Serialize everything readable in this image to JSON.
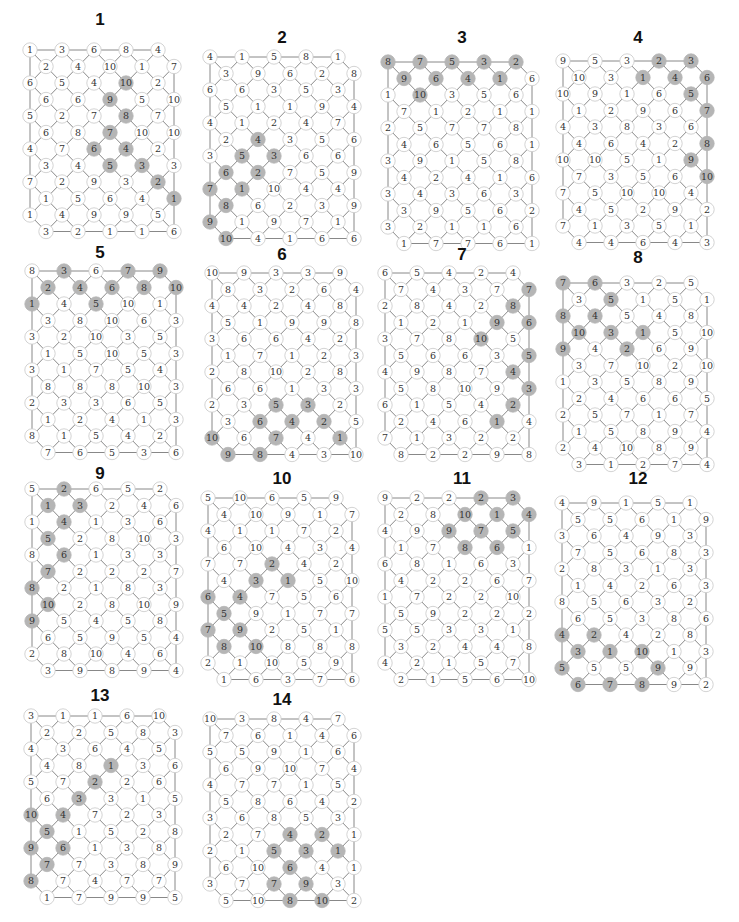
{
  "style": {
    "node_fill": "#ffffff",
    "node_stroke": "#c8c8c8",
    "shaded_fill": "#b5b5b5",
    "edge_color": "#6a6a6a",
    "text_color": "#333333"
  },
  "puzzles": [
    {
      "id": "1",
      "title": "1",
      "origin": [
        30,
        50
      ],
      "title_pos": [
        100,
        10
      ],
      "rows": [
        [
          "1",
          "3",
          "6",
          "8",
          "4"
        ],
        [
          "2",
          "4",
          "10",
          "1",
          "7"
        ],
        [
          "6",
          "5",
          "4",
          "10*",
          "2"
        ],
        [
          "6",
          "6",
          "9*",
          "5",
          "10"
        ],
        [
          "5",
          "2",
          "7",
          "8*",
          "7"
        ],
        [
          "6",
          "8",
          "7*",
          "10",
          "10"
        ],
        [
          "4",
          "7",
          "6*",
          "4*",
          "2"
        ],
        [
          "3",
          "4",
          "5*",
          "3*",
          "3"
        ],
        [
          "7",
          "2",
          "9",
          "3",
          "2*"
        ],
        [
          "1",
          "5",
          "6",
          "4",
          "1*"
        ],
        [
          "1",
          "4",
          "9",
          "9",
          "5"
        ],
        [
          "3",
          "2",
          "1",
          "1",
          "6"
        ]
      ]
    },
    {
      "id": "2",
      "title": "2",
      "origin": [
        210,
        57
      ],
      "title_pos": [
        282,
        28
      ],
      "rows": [
        [
          "4",
          "1",
          "5",
          "8",
          "1"
        ],
        [
          "3",
          "9",
          "6",
          "2",
          "8"
        ],
        [
          "6",
          "6",
          "3",
          "5",
          "3"
        ],
        [
          "5",
          "1",
          "1",
          "9",
          "4"
        ],
        [
          "4",
          "1",
          "2",
          "4",
          "7"
        ],
        [
          "2",
          "4*",
          "3",
          "5",
          "6"
        ],
        [
          "3",
          "5*",
          "3*",
          "6",
          "6"
        ],
        [
          "6*",
          "2*",
          "7",
          "5",
          "9"
        ],
        [
          "7*",
          "1*",
          "10",
          "4",
          "4"
        ],
        [
          "8*",
          "6",
          "2",
          "3",
          "9"
        ],
        [
          "9*",
          "1",
          "9",
          "7",
          "1"
        ],
        [
          "10*",
          "4",
          "1",
          "6",
          "6"
        ]
      ]
    },
    {
      "id": "3",
      "title": "3",
      "origin": [
        388,
        62
      ],
      "title_pos": [
        462,
        28
      ],
      "rows": [
        [
          "8*",
          "7*",
          "5*",
          "3*",
          "2*"
        ],
        [
          "9*",
          "6*",
          "4*",
          "1*",
          "6"
        ],
        [
          "1",
          "10*",
          "3",
          "5",
          "6"
        ],
        [
          "7",
          "1",
          "2",
          "1",
          "1"
        ],
        [
          "2",
          "5",
          "7",
          "7",
          "8"
        ],
        [
          "4",
          "6",
          "5",
          "6",
          "1"
        ],
        [
          "3",
          "9",
          "1",
          "5",
          "8"
        ],
        [
          "4",
          "2",
          "4",
          "1",
          "6"
        ],
        [
          "3",
          "4",
          "3",
          "6",
          "3"
        ],
        [
          "3",
          "9",
          "5",
          "6",
          "2"
        ],
        [
          "3",
          "2",
          "1",
          "1",
          "6"
        ],
        [
          "1",
          "7",
          "7",
          "6",
          "1"
        ]
      ]
    },
    {
      "id": "4",
      "title": "4",
      "origin": [
        563,
        61
      ],
      "title_pos": [
        638,
        28
      ],
      "rows": [
        [
          "9",
          "5",
          "3",
          "2*",
          "3*"
        ],
        [
          "10",
          "3",
          "1*",
          "4*",
          "6*"
        ],
        [
          "10",
          "9",
          "1",
          "6",
          "5*"
        ],
        [
          "1",
          "2",
          "9",
          "6",
          "7*"
        ],
        [
          "4",
          "3",
          "8",
          "3",
          "6"
        ],
        [
          "4",
          "6",
          "4",
          "2",
          "8*"
        ],
        [
          "10",
          "10",
          "5",
          "1",
          "9*"
        ],
        [
          "7",
          "3",
          "5",
          "6",
          "10*"
        ],
        [
          "7",
          "5",
          "10",
          "10",
          "4"
        ],
        [
          "4",
          "5",
          "2",
          "9",
          "2"
        ],
        [
          "7",
          "1",
          "3",
          "5",
          "1"
        ],
        [
          "4",
          "4",
          "6",
          "4",
          "3"
        ]
      ]
    },
    {
      "id": "5",
      "title": "5",
      "origin": [
        32,
        271
      ],
      "title_pos": [
        100,
        243
      ],
      "rows": [
        [
          "8",
          "3*",
          "6",
          "7*",
          "9*"
        ],
        [
          "2*",
          "4*",
          "6*",
          "8*",
          "10*"
        ],
        [
          "1*",
          "4",
          "5*",
          "10",
          "1"
        ],
        [
          "3",
          "8",
          "10",
          "6",
          "3"
        ],
        [
          "3",
          "2",
          "10",
          "3",
          "5"
        ],
        [
          "1",
          "5",
          "10",
          "5",
          "3"
        ],
        [
          "3",
          "1",
          "7",
          "5",
          "4"
        ],
        [
          "8",
          "8",
          "8",
          "10",
          "3"
        ],
        [
          "2",
          "3",
          "3",
          "6",
          "5"
        ],
        [
          "1",
          "2",
          "4",
          "1",
          "3"
        ],
        [
          "8",
          "1",
          "5",
          "4",
          "2"
        ],
        [
          "7",
          "6",
          "5",
          "3",
          "6"
        ]
      ]
    },
    {
      "id": "6",
      "title": "6",
      "origin": [
        212,
        273
      ],
      "title_pos": [
        282,
        245
      ],
      "rows": [
        [
          "10",
          "9",
          "3",
          "3",
          "9"
        ],
        [
          "8",
          "3",
          "2",
          "6",
          "4"
        ],
        [
          "4",
          "4",
          "2",
          "4",
          "8"
        ],
        [
          "5",
          "1",
          "9",
          "9",
          "8"
        ],
        [
          "3",
          "6",
          "6",
          "4",
          "2"
        ],
        [
          "1",
          "7",
          "1",
          "2",
          "3"
        ],
        [
          "2",
          "8",
          "10",
          "2",
          "8"
        ],
        [
          "6",
          "6",
          "1",
          "3",
          "3"
        ],
        [
          "2",
          "3",
          "5*",
          "3*",
          "2"
        ],
        [
          "3",
          "6*",
          "4*",
          "2*",
          "5"
        ],
        [
          "10*",
          "6",
          "7*",
          "4",
          "1*"
        ],
        [
          "9*",
          "8*",
          "4",
          "3",
          "10"
        ]
      ]
    },
    {
      "id": "7",
      "title": "7",
      "origin": [
        385,
        273
      ],
      "title_pos": [
        462,
        245
      ],
      "rows": [
        [
          "6",
          "5",
          "4",
          "2",
          "4"
        ],
        [
          "7",
          "4",
          "3",
          "7",
          "7*"
        ],
        [
          "2",
          "8",
          "4",
          "2",
          "8*"
        ],
        [
          "1",
          "2",
          "1",
          "9*",
          "6*"
        ],
        [
          "3",
          "7",
          "8",
          "10*",
          "5"
        ],
        [
          "5",
          "6",
          "6",
          "3",
          "5*"
        ],
        [
          "4",
          "9",
          "8",
          "7",
          "4*"
        ],
        [
          "5",
          "8",
          "10",
          "9",
          "3*"
        ],
        [
          "6",
          "1",
          "5",
          "4",
          "2*"
        ],
        [
          "2",
          "4",
          "6",
          "1*",
          "4"
        ],
        [
          "7",
          "1",
          "3",
          "2",
          "2"
        ],
        [
          "8",
          "2",
          "2",
          "9",
          "8"
        ]
      ]
    },
    {
      "id": "8",
      "title": "8",
      "origin": [
        563,
        283
      ],
      "title_pos": [
        638,
        248
      ],
      "rows": [
        [
          "7*",
          "6*",
          "3",
          "2",
          "5"
        ],
        [
          "3",
          "5*",
          "1",
          "5",
          "1"
        ],
        [
          "8*",
          "4*",
          "5",
          "4",
          "8"
        ],
        [
          "10*",
          "3*",
          "1*",
          "5",
          "10"
        ],
        [
          "9*",
          "4",
          "2*",
          "6",
          "9"
        ],
        [
          "3",
          "7",
          "10",
          "2",
          "10"
        ],
        [
          "1",
          "3",
          "5",
          "8",
          "9"
        ],
        [
          "2",
          "4",
          "6",
          "6",
          "5"
        ],
        [
          "2",
          "5",
          "7",
          "1",
          "7"
        ],
        [
          "1",
          "5",
          "8",
          "9",
          "4"
        ],
        [
          "2",
          "4",
          "10",
          "8",
          "9"
        ],
        [
          "3",
          "1",
          "2",
          "7",
          "4"
        ]
      ]
    },
    {
      "id": "9",
      "title": "9",
      "origin": [
        32,
        489
      ],
      "title_pos": [
        100,
        464
      ],
      "rows": [
        [
          "5",
          "2*",
          "6",
          "5",
          "2"
        ],
        [
          "1*",
          "3*",
          "2",
          "4",
          "6"
        ],
        [
          "1",
          "4*",
          "1",
          "3",
          "6"
        ],
        [
          "5*",
          "2",
          "8",
          "10",
          "3"
        ],
        [
          "8",
          "6*",
          "1",
          "3",
          "3"
        ],
        [
          "7*",
          "2",
          "2",
          "2",
          "7"
        ],
        [
          "8*",
          "2",
          "1",
          "8",
          "3"
        ],
        [
          "10*",
          "2",
          "8",
          "10",
          "9"
        ],
        [
          "9*",
          "5",
          "4",
          "5",
          "8"
        ],
        [
          "6",
          "5",
          "9",
          "5",
          "4"
        ],
        [
          "2",
          "8",
          "10",
          "4",
          "6"
        ],
        [
          "3",
          "9",
          "8",
          "9",
          "4"
        ]
      ]
    },
    {
      "id": "10",
      "title": "10",
      "origin": [
        208,
        498
      ],
      "title_pos": [
        282,
        469
      ],
      "rows": [
        [
          "5",
          "10",
          "6",
          "5",
          "9"
        ],
        [
          "4",
          "10",
          "9",
          "1",
          "7"
        ],
        [
          "4",
          "1",
          "1",
          "7",
          "2"
        ],
        [
          "6",
          "10",
          "4",
          "3",
          "4"
        ],
        [
          "7",
          "7",
          "2*",
          "4",
          "2"
        ],
        [
          "4",
          "3*",
          "1*",
          "5",
          "10"
        ],
        [
          "6*",
          "4*",
          "7",
          "5",
          "6"
        ],
        [
          "5*",
          "9",
          "1",
          "7",
          "7"
        ],
        [
          "7*",
          "9*",
          "2",
          "5",
          "1"
        ],
        [
          "8*",
          "10*",
          "8",
          "8",
          "8"
        ],
        [
          "2",
          "1",
          "10",
          "5",
          "9"
        ],
        [
          "1",
          "6",
          "3",
          "7",
          "6"
        ]
      ]
    },
    {
      "id": "11",
      "title": "11",
      "origin": [
        385,
        498
      ],
      "title_pos": [
        462,
        469
      ],
      "rows": [
        [
          "9",
          "2",
          "2",
          "2*",
          "3*"
        ],
        [
          "2",
          "8",
          "10*",
          "1*",
          "4*"
        ],
        [
          "4",
          "9",
          "9*",
          "7*",
          "5*"
        ],
        [
          "1",
          "7",
          "8*",
          "6*",
          "1"
        ],
        [
          "6",
          "8",
          "1",
          "6",
          "3"
        ],
        [
          "4",
          "2",
          "2",
          "6",
          "7"
        ],
        [
          "1",
          "7",
          "2",
          "2",
          "10"
        ],
        [
          "5",
          "9",
          "2",
          "2",
          "2"
        ],
        [
          "5",
          "5",
          "3",
          "3",
          "1"
        ],
        [
          "3",
          "2",
          "4",
          "4",
          "8"
        ],
        [
          "4",
          "2",
          "1",
          "5",
          "7"
        ],
        [
          "2",
          "1",
          "5",
          "6",
          "10"
        ]
      ]
    },
    {
      "id": "12",
      "title": "12",
      "origin": [
        562,
        503
      ],
      "title_pos": [
        638,
        469
      ],
      "rows": [
        [
          "4",
          "9",
          "1",
          "5",
          "1"
        ],
        [
          "5",
          "5",
          "6",
          "1",
          "9"
        ],
        [
          "3",
          "6",
          "4",
          "9",
          "3"
        ],
        [
          "7",
          "5",
          "6",
          "8",
          "3"
        ],
        [
          "2",
          "8",
          "3",
          "1",
          "3"
        ],
        [
          "1",
          "4",
          "2",
          "6",
          "3"
        ],
        [
          "8",
          "5",
          "6",
          "3",
          "2"
        ],
        [
          "6",
          "5",
          "3",
          "8",
          "6"
        ],
        [
          "4*",
          "2*",
          "4",
          "2",
          "8"
        ],
        [
          "3*",
          "1*",
          "10*",
          "1",
          "3"
        ],
        [
          "5*",
          "5",
          "5",
          "9*",
          "9"
        ],
        [
          "6*",
          "7*",
          "8*",
          "9",
          "2"
        ]
      ]
    },
    {
      "id": "13",
      "title": "13",
      "origin": [
        31,
        716
      ],
      "title_pos": [
        100,
        686
      ],
      "rows": [
        [
          "3",
          "1",
          "1",
          "6",
          "10"
        ],
        [
          "2",
          "2",
          "5",
          "8",
          "3"
        ],
        [
          "4",
          "3",
          "6",
          "4",
          "5"
        ],
        [
          "4",
          "8",
          "1*",
          "3",
          "6"
        ],
        [
          "5",
          "7",
          "2*",
          "2",
          "6"
        ],
        [
          "6",
          "3*",
          "3",
          "1",
          "5"
        ],
        [
          "10*",
          "4*",
          "7",
          "2",
          "3"
        ],
        [
          "5*",
          "1",
          "5",
          "2",
          "8"
        ],
        [
          "9*",
          "6*",
          "1",
          "3",
          "8"
        ],
        [
          "7*",
          "7",
          "3",
          "8",
          "9"
        ],
        [
          "8*",
          "7",
          "4",
          "7",
          "7"
        ],
        [
          "1",
          "7",
          "9",
          "9",
          "5"
        ]
      ]
    },
    {
      "id": "14",
      "title": "14",
      "origin": [
        210,
        719
      ],
      "title_pos": [
        282,
        690
      ],
      "rows": [
        [
          "10",
          "3",
          "8",
          "4",
          "7"
        ],
        [
          "7",
          "6",
          "1",
          "4",
          "6"
        ],
        [
          "5",
          "5",
          "9",
          "1",
          "6"
        ],
        [
          "6",
          "9",
          "10",
          "7",
          "4"
        ],
        [
          "4",
          "7",
          "7",
          "1",
          "5"
        ],
        [
          "5",
          "8",
          "6",
          "4",
          "2"
        ],
        [
          "3",
          "6",
          "8",
          "5",
          "3"
        ],
        [
          "2",
          "7",
          "4*",
          "2*",
          "1"
        ],
        [
          "2",
          "1",
          "5*",
          "3*",
          "1*"
        ],
        [
          "6",
          "10",
          "6*",
          "4",
          "1"
        ],
        [
          "3",
          "7",
          "7*",
          "9*",
          "3"
        ],
        [
          "5",
          "10",
          "8*",
          "10*",
          "2"
        ]
      ]
    }
  ]
}
